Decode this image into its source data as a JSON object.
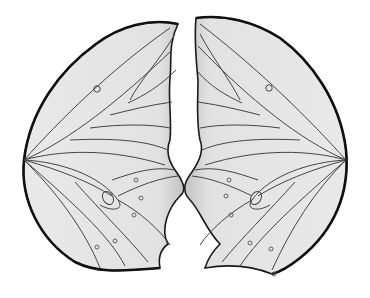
{
  "illustration": {
    "subject": "butterfly-wings",
    "wing_count": 2,
    "colors": {
      "background": "#ffffff",
      "wing_fill": "#e6e6e6",
      "wing_shade": "#c4c4c4",
      "outline": "#1a1a1a",
      "vein": "#444444"
    }
  }
}
